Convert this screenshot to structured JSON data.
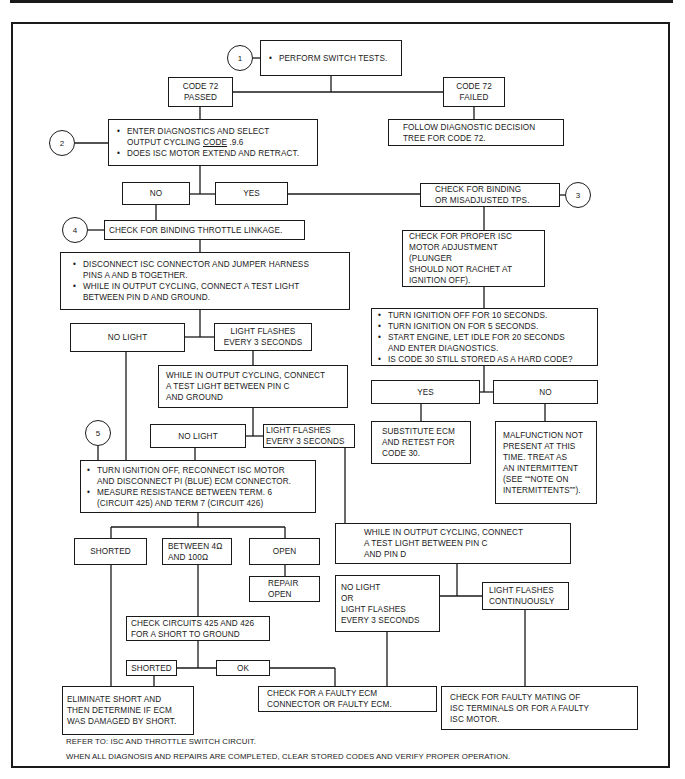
{
  "diagram": {
    "type": "flowchart",
    "steps": {
      "circle_1": "1",
      "circle_2": "2",
      "circle_3": "3",
      "circle_4": "4",
      "circle_5": "5"
    },
    "nodes": {
      "perform_switch_tests": "PERFORM SWITCH TESTS.",
      "code72_passed": [
        "CODE 72",
        "PASSED"
      ],
      "code72_failed": [
        "CODE 72",
        "FAILED"
      ],
      "follow_tree": [
        "FOLLOW DIAGNOSTIC DECISION",
        "TREE FOR CODE 72."
      ],
      "enter_diag": {
        "line1": "ENTER DIAGNOSTICS AND SELECT",
        "line2_prefix": "OUTPUT CYCLING ",
        "line2_underlined": "CODE",
        "line2_suffix": " .9.6",
        "bullet2": "DOES ISC MOTOR EXTEND AND RETRACT."
      },
      "no_1": "NO",
      "yes_1": "YES",
      "check_binding_tps": [
        "CHECK FOR BINDING",
        "OR MISADJUSTED TPS."
      ],
      "check_binding_throttle": "CHECK FOR BINDING THROTTLE LINKAGE.",
      "disconnect_isc": {
        "bullet1": [
          "DISCONNECT ISC CONNECTOR AND JUMPER HARNESS",
          "PINS A  AND B TOGETHER."
        ],
        "bullet2": [
          "WHILE IN OUTPUT CYCLING, CONNECT A TEST LIGHT",
          "BETWEEN PIN D AND GROUND."
        ]
      },
      "no_light_1": "NO LIGHT",
      "light_flashes_1": [
        "LIGHT FLASHES",
        "EVERY 3 SECONDS"
      ],
      "check_isc_adjustment": [
        "CHECK FOR PROPER ISC",
        "MOTOR ADJUSTMENT (PLUNGER",
        "SHOULD NOT RACHET AT",
        "IGNITION OFF)."
      ],
      "turn_ignition": {
        "bullet1": "TURN IGNITION OFF FOR 10 SECONDS.",
        "bullet2": "TURN IGNITION ON FOR 5 SECONDS.",
        "bullet3": [
          "START ENGINE, LET IDLE FOR 20 SECONDS",
          "AND ENTER DIAGNOSTICS."
        ],
        "bullet4": "IS CODE 30 STILL STORED AS A HARD CODE?"
      },
      "yes_2": "YES",
      "no_2": "NO",
      "substitute_ecm": [
        "SUBSTITUTE ECM",
        "AND RETEST FOR",
        "CODE 30."
      ],
      "malfunction_not_present": [
        "MALFUNCTION NOT",
        "PRESENT AT THIS",
        "TIME. TREAT AS",
        "AN INTERMITTENT",
        "(SEE ““NOTE ON",
        "INTERMITTENTS””)."
      ],
      "pin_c_ground": [
        "WHILE IN OUTPUT CYCLING, CONNECT",
        "A TEST LIGHT BETWEEN PIN C",
        "AND GROUND"
      ],
      "no_light_2": "NO LIGHT",
      "light_flashes_2": [
        "LIGHT FLASHES",
        "EVERY 3 SECONDS"
      ],
      "measure_resistance": {
        "bullet1": [
          "TURN IGNITION OFF, RECONNECT ISC MOTOR",
          "AND DISCONNECT PI (BLUE) ECM CONNECTOR."
        ],
        "bullet2": [
          "MEASURE RESISTANCE BETWEEN TERM. 6",
          "(CIRCUIT 425) AND TERM 7 (CIRCUIT 426)"
        ]
      },
      "pin_c_pin_d": [
        "WHILE IN OUTPUT CYCLING, CONNECT",
        "A TEST LIGHT BETWEEN PIN C",
        "AND PIN D"
      ],
      "shorted_1": "SHORTED",
      "between": [
        "BETWEEN 4Ω",
        "AND 100Ω"
      ],
      "open": "OPEN",
      "repair_open": [
        "REPAIR",
        "OPEN"
      ],
      "no_light_or_flash": [
        "NO LIGHT",
        "OR",
        "LIGHT FLASHES",
        "EVERY 3 SECONDS"
      ],
      "light_flashes_continuously": [
        "LIGHT FLASHES",
        "CONTINUOUSLY"
      ],
      "check_circuits": [
        "CHECK CIRCUITS 425 AND 426",
        "FOR A SHORT TO GROUND"
      ],
      "shorted_2": "SHORTED",
      "ok": "OK",
      "eliminate_short": [
        "ELIMINATE SHORT AND",
        "THEN DETERMINE IF ECM",
        "WAS DAMAGED BY SHORT."
      ],
      "faulty_ecm": [
        "CHECK FOR A FAULTY ECM",
        "CONNECTOR OR FAULTY ECM."
      ],
      "faulty_mating": [
        "CHECK FOR FAULTY MATING OF",
        "ISC TERMINALS OR FOR A FAULTY",
        "ISC MOTOR."
      ]
    },
    "footer": {
      "refer_to": "REFER TO: ISC AND THROTTLE SWITCH CIRCUIT.",
      "when_complete": "WHEN ALL DIAGNOSIS AND REPAIRS ARE COMPLETED, CLEAR STORED CODES AND VERIFY PROPER OPERATION."
    }
  }
}
